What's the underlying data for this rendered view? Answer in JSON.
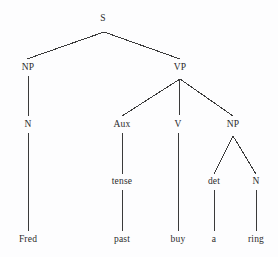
{
  "diagram": {
    "type": "constituency-parse-tree",
    "sentence": "Fred past buy a ring",
    "background_color": "#fdfdfe",
    "line_color": "#3a3a3a",
    "text_color": "#2b2b2b",
    "nodes": [
      {
        "id": "s",
        "label": "S",
        "x": 103,
        "y": 19,
        "kind": "nonterminal"
      },
      {
        "id": "np1",
        "label": "NP",
        "x": 28,
        "y": 68,
        "kind": "nonterminal"
      },
      {
        "id": "vp",
        "label": "VP",
        "x": 180,
        "y": 68,
        "kind": "nonterminal"
      },
      {
        "id": "n1",
        "label": "N",
        "x": 28,
        "y": 125,
        "kind": "nonterminal"
      },
      {
        "id": "aux",
        "label": "Aux",
        "x": 122,
        "y": 125,
        "kind": "nonterminal"
      },
      {
        "id": "v",
        "label": "V",
        "x": 178,
        "y": 125,
        "kind": "nonterminal"
      },
      {
        "id": "np2",
        "label": "NP",
        "x": 233,
        "y": 125,
        "kind": "nonterminal"
      },
      {
        "id": "tense",
        "label": "tense",
        "x": 122,
        "y": 182,
        "kind": "nonterminal"
      },
      {
        "id": "det",
        "label": "det",
        "x": 214,
        "y": 182,
        "kind": "nonterminal"
      },
      {
        "id": "n2",
        "label": "N",
        "x": 256,
        "y": 182,
        "kind": "nonterminal"
      },
      {
        "id": "fred",
        "label": "Fred",
        "x": 28,
        "y": 240,
        "kind": "terminal"
      },
      {
        "id": "past",
        "label": "past",
        "x": 122,
        "y": 240,
        "kind": "terminal"
      },
      {
        "id": "buy",
        "label": "buy",
        "x": 178,
        "y": 240,
        "kind": "terminal"
      },
      {
        "id": "a",
        "label": "a",
        "x": 214,
        "y": 240,
        "kind": "terminal"
      },
      {
        "id": "ring",
        "label": "ring",
        "x": 256,
        "y": 240,
        "kind": "terminal"
      }
    ],
    "edges": [
      {
        "from": "s",
        "to": "np1",
        "x1": 104,
        "y1": 32,
        "x2": 27,
        "y2": 59
      },
      {
        "from": "s",
        "to": "vp",
        "x1": 104,
        "y1": 32,
        "x2": 180,
        "y2": 59
      },
      {
        "from": "np1",
        "to": "n1",
        "x1": 28,
        "y1": 76,
        "x2": 28,
        "y2": 116
      },
      {
        "from": "vp",
        "to": "aux",
        "x1": 180,
        "y1": 79,
        "x2": 122,
        "y2": 116
      },
      {
        "from": "vp",
        "to": "v",
        "x1": 180,
        "y1": 79,
        "x2": 179,
        "y2": 116
      },
      {
        "from": "vp",
        "to": "np2",
        "x1": 180,
        "y1": 79,
        "x2": 233,
        "y2": 116
      },
      {
        "from": "n1",
        "to": "fred",
        "x1": 28,
        "y1": 133,
        "x2": 28,
        "y2": 231
      },
      {
        "from": "aux",
        "to": "tense",
        "x1": 122,
        "y1": 133,
        "x2": 122,
        "y2": 174
      },
      {
        "from": "v",
        "to": "buy",
        "x1": 178,
        "y1": 133,
        "x2": 178,
        "y2": 231
      },
      {
        "from": "np2",
        "to": "det",
        "x1": 233,
        "y1": 136,
        "x2": 214,
        "y2": 174
      },
      {
        "from": "np2",
        "to": "n2",
        "x1": 233,
        "y1": 136,
        "x2": 256,
        "y2": 174
      },
      {
        "from": "tense",
        "to": "past",
        "x1": 122,
        "y1": 190,
        "x2": 122,
        "y2": 231
      },
      {
        "from": "det",
        "to": "a",
        "x1": 214,
        "y1": 190,
        "x2": 214,
        "y2": 231
      },
      {
        "from": "n2",
        "to": "ring",
        "x1": 256,
        "y1": 190,
        "x2": 256,
        "y2": 231
      }
    ]
  }
}
